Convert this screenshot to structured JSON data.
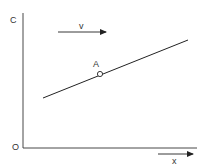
{
  "diagram": {
    "type": "concentration-profile",
    "labels": {
      "y_axis": "C",
      "origin": "O",
      "x_axis": "x",
      "velocity": "v",
      "point": "A"
    },
    "colors": {
      "line": "#222222",
      "text": "#333333",
      "background": "#ffffff"
    },
    "geometry": {
      "line_start": [
        43,
        98
      ],
      "line_end": [
        188,
        40
      ],
      "point_A": [
        100,
        74
      ]
    }
  }
}
